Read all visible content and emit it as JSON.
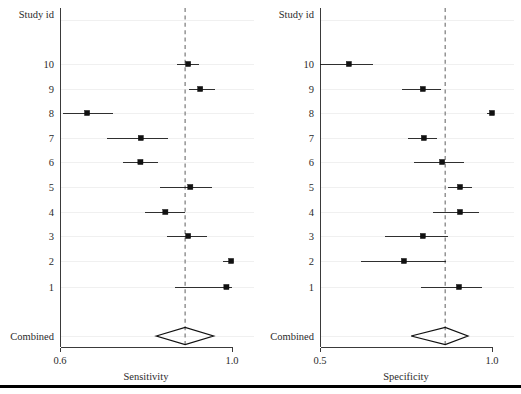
{
  "figure": {
    "background": "#ffffff",
    "marker_color": "#111111",
    "reference_line_color": "#8c8c8c",
    "axis_color": "#3a3a3a",
    "gridline_color": "#f0f0f0",
    "bottom_rule_color": "#000000"
  },
  "row_labels": {
    "header": "Study id",
    "studies": [
      "10",
      "9",
      "8",
      "7",
      "6",
      "5",
      "4",
      "3",
      "2",
      "1"
    ],
    "summary": "Combined"
  },
  "chart_data": [
    {
      "type": "scatter",
      "name": "sensitivity-forest-plot",
      "title": "",
      "xlabel": "Sensitivity",
      "ylabel": "Study id",
      "xlim": [
        0.6,
        1.0
      ],
      "xticks": [
        0.6,
        1.0
      ],
      "xtick_labels": [
        "0.6",
        "1.0"
      ],
      "grid": true,
      "legend": "none",
      "reference_line": 0.891,
      "categories": [
        "10",
        "9",
        "8",
        "7",
        "6",
        "5",
        "4",
        "3",
        "2",
        "1"
      ],
      "estimates": [
        0.898,
        0.926,
        0.663,
        0.788,
        0.787,
        0.903,
        0.845,
        0.898,
        0.998,
        0.987
      ],
      "ci_low": [
        0.873,
        0.901,
        0.607,
        0.709,
        0.746,
        0.832,
        0.798,
        0.849,
        0.98,
        0.868
      ],
      "ci_high": [
        0.924,
        0.961,
        0.723,
        0.851,
        0.828,
        0.953,
        0.891,
        0.942,
        1.0,
        1.0
      ],
      "summary": {
        "label": "Combined",
        "estimate": 0.891,
        "ci_low": 0.824,
        "ci_high": 0.957
      }
    },
    {
      "type": "scatter",
      "name": "specificity-forest-plot",
      "title": "",
      "xlabel": "Specificity",
      "ylabel": "Study id",
      "xlim": [
        0.5,
        1.0
      ],
      "xticks": [
        0.5,
        1.0
      ],
      "xtick_labels": [
        "0.5",
        "1.0"
      ],
      "grid": true,
      "legend": "none",
      "reference_line": 0.864,
      "categories": [
        "10",
        "9",
        "8",
        "7",
        "6",
        "5",
        "4",
        "3",
        "2",
        "1"
      ],
      "estimates": [
        0.584,
        0.799,
        1.0,
        0.802,
        0.855,
        0.907,
        0.907,
        0.799,
        0.744,
        0.904
      ],
      "ci_low": [
        0.488,
        0.738,
        0.986,
        0.756,
        0.773,
        0.872,
        0.829,
        0.689,
        0.619,
        0.795
      ],
      "ci_high": [
        0.654,
        0.852,
        1.0,
        0.841,
        0.919,
        0.942,
        0.962,
        0.872,
        0.866,
        0.97
      ],
      "summary": {
        "label": "Combined",
        "estimate": 0.864,
        "ci_low": 0.765,
        "ci_high": 0.93
      }
    }
  ]
}
